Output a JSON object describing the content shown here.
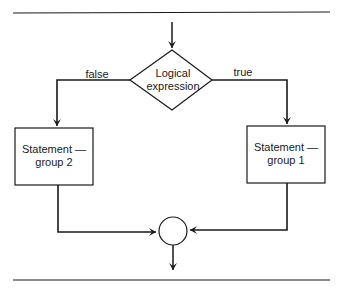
{
  "diagram": {
    "type": "flowchart-if-else",
    "decision": {
      "text": "Logical\nexpression"
    },
    "branches": {
      "false_label": "false",
      "true_label": "true"
    },
    "left_box": {
      "text": "Statement —\ngroup 2"
    },
    "right_box": {
      "text": "Statement —\ngroup 1"
    },
    "join": {
      "shape": "circle"
    },
    "colors": {
      "line": "#1a1a1a",
      "background": "#ffffff"
    }
  }
}
